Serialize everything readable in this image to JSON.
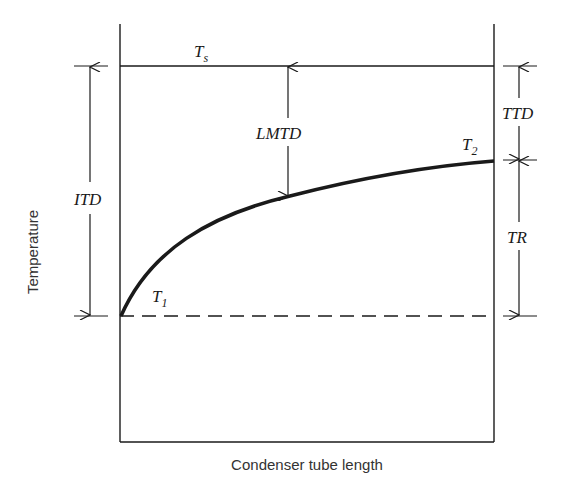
{
  "diagram": {
    "title": "",
    "labels": {
      "ts": "T",
      "ts_sub": "s",
      "t1": "T",
      "t1_sub": "1",
      "t2": "T",
      "t2_sub": "2",
      "lmtd": "LMTD",
      "itd": "ITD",
      "ttd": "TTD",
      "tr": "TR"
    },
    "axes": {
      "xlabel": "Condenser tube length",
      "ylabel": "Temperature"
    },
    "colors": {
      "line": "#1a1a1a",
      "background": "#ffffff"
    }
  }
}
